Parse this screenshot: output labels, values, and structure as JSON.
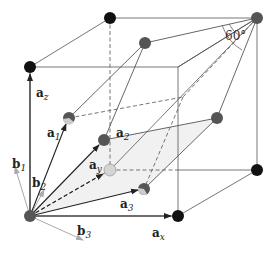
{
  "diagram": {
    "type": "crystal-lattice",
    "angle_label": "60°",
    "labels": {
      "ax": {
        "base": "a",
        "sub": "x"
      },
      "ay": {
        "base": "a",
        "sub": "y"
      },
      "az": {
        "base": "a",
        "sub": "z"
      },
      "a1": {
        "base": "a",
        "sub": "1"
      },
      "a2": {
        "base": "a",
        "sub": "2"
      },
      "a3": {
        "base": "a",
        "sub": "3"
      },
      "b1": {
        "base": "b",
        "sub": "1"
      },
      "b2": {
        "base": "b",
        "sub": "2"
      },
      "b3": {
        "base": "b",
        "sub": "3"
      }
    },
    "colors": {
      "black_atom": "#111111",
      "gray_atom": "#555555",
      "light_atom": "#cccccc",
      "line": "#555555",
      "reciprocal_arrow": "#aaaaaa",
      "plane_fill": "#f0f0f0"
    }
  }
}
